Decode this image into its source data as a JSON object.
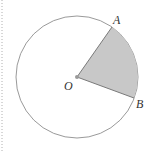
{
  "diagram": {
    "labels": {
      "center": "O",
      "point_a": "A",
      "point_b": "B"
    },
    "geometry": {
      "center": [
        77,
        77
      ],
      "radius": 61,
      "point_a": [
        112,
        27
      ],
      "point_b": [
        134,
        98
      ]
    },
    "colors": {
      "circle_stroke": "#9a9a9a",
      "sector_fill": "#c8c8c8",
      "sector_edge": "#7a7a7a",
      "dotted_border": "#b0b0b0"
    }
  }
}
